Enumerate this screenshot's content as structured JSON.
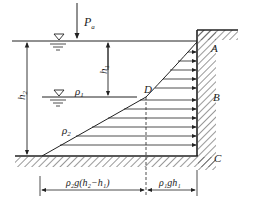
{
  "diagram": {
    "labels": {
      "surface_pressure": "P",
      "surface_pressure_sub": "a",
      "depth_h1": "h",
      "depth_h1_sub": "1",
      "depth_h2": "h",
      "depth_h2_sub": "2",
      "density_upper": "ρ",
      "density_upper_sub": "1",
      "density_lower": "ρ",
      "density_lower_sub": "2",
      "point_a": "A",
      "point_b": "B",
      "point_c": "C",
      "point_d": "D",
      "dim_lower": "ρ₂g(h₂−h₁)",
      "dim_upper": "ρ₁gh₁"
    },
    "colors": {
      "stroke": "#222222",
      "background": "#ffffff"
    }
  }
}
